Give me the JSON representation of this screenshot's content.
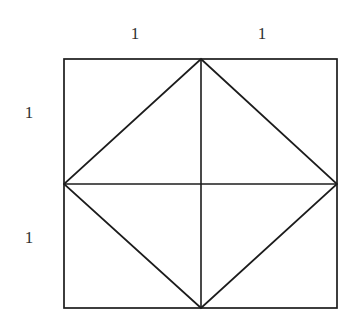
{
  "figure": {
    "background_color": "#ffffff",
    "stroke_color": "#1c1c1c",
    "stroke_width": 1.7,
    "canvas": {
      "width": 361,
      "height": 329
    },
    "outer_rectangle": {
      "name": "outer-square",
      "x": 64,
      "y": 59,
      "width": 273,
      "height": 249,
      "filled": false
    },
    "points": {
      "top_left": {
        "x": 64,
        "y": 59
      },
      "top_right": {
        "x": 337,
        "y": 59
      },
      "bottom_right": {
        "x": 337,
        "y": 308
      },
      "bottom_left": {
        "x": 64,
        "y": 308
      },
      "top_mid": {
        "x": 201,
        "y": 59
      },
      "right_mid": {
        "x": 337,
        "y": 184
      },
      "bottom_mid": {
        "x": 201,
        "y": 308
      },
      "left_mid": {
        "x": 64,
        "y": 184
      },
      "center": {
        "x": 201,
        "y": 184
      }
    },
    "inscribed_diamond": {
      "name": "inscribed-rotated-square",
      "vertices": "201,59 337,184 201,308 64,184",
      "filled": false
    },
    "median_lines": [
      {
        "name": "vertical-median",
        "x1": 201,
        "y1": 59,
        "x2": 201,
        "y2": 308
      },
      {
        "name": "horizontal-median",
        "x1": 64,
        "y1": 184,
        "x2": 337,
        "y2": 184
      }
    ],
    "labels": [
      {
        "id": "top-left-length",
        "text": "1",
        "x": 135,
        "y": 33,
        "edge": "top-left-half"
      },
      {
        "id": "top-right-length",
        "text": "1",
        "x": 262,
        "y": 33,
        "edge": "top-right-half"
      },
      {
        "id": "left-upper-length",
        "text": "1",
        "x": 29,
        "y": 112,
        "edge": "left-upper-half"
      },
      {
        "id": "left-lower-length",
        "text": "1",
        "x": 29,
        "y": 237,
        "edge": "left-lower-half"
      }
    ]
  },
  "chart_data": {
    "type": "diagram",
    "dimension_labels": [
      "1",
      "1",
      "1",
      "1"
    ],
    "segment_length": 1,
    "side_length_total": 2,
    "shapes": [
      "outer-square",
      "inscribed-rotated-square",
      "vertical-median",
      "horizontal-median"
    ]
  }
}
